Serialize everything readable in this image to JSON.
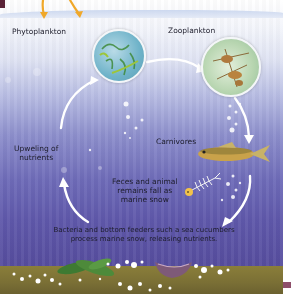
{
  "diagram": {
    "nodes": [
      {
        "id": "phytoplankton",
        "label": "Phytoplankton"
      },
      {
        "id": "zooplankton",
        "label": "Zooplankton"
      },
      {
        "id": "carnivores",
        "label": "Carnivores"
      },
      {
        "id": "marine_snow",
        "label_lines": [
          "Feces and animal",
          "remains fall as",
          "marine snow"
        ]
      },
      {
        "id": "decomposers",
        "label_lines": [
          "Bacteria and bottom feeders such a sea cucumbers",
          "process marine snow, releasing nutrients."
        ]
      },
      {
        "id": "upwelling",
        "label_lines": [
          "Upweling of",
          "nutrients"
        ]
      }
    ],
    "edges": [
      {
        "from": "phytoplankton",
        "to": "zooplankton"
      },
      {
        "from": "zooplankton",
        "to": "carnivores"
      },
      {
        "from": "carnivores",
        "to": "decomposers"
      },
      {
        "from": "decomposers",
        "to": "upwelling"
      },
      {
        "from": "upwelling",
        "to": "phytoplankton"
      }
    ],
    "colors": {
      "sunlight_arrows": "#f0a82a",
      "cycle_arrows": "#ffffff",
      "water_top": "#f3f5fb",
      "water_deep": "#574e9f",
      "sediment": "#7a6f35",
      "text": "#1d1d2b"
    }
  }
}
